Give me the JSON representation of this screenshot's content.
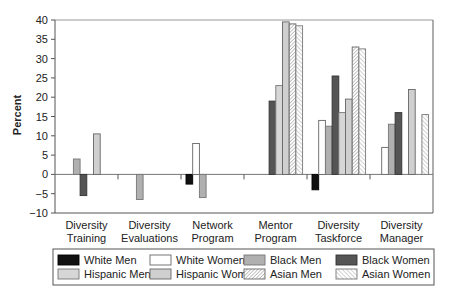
{
  "chart_data": {
    "type": "bar",
    "title": "",
    "xlabel": "",
    "ylabel": "Percent",
    "ylim": [
      -10,
      40
    ],
    "yticks": [
      40,
      35,
      30,
      25,
      20,
      15,
      10,
      5,
      0,
      -5,
      -10
    ],
    "grid": false,
    "legend_position": "bottom",
    "categories": [
      "Diversity Training",
      "Diversity Evaluations",
      "Network Program",
      "Mentor Program",
      "Diversity Taskforce",
      "Diversity Manager"
    ],
    "category_labels": [
      [
        "Diversity",
        "Training"
      ],
      [
        "Diversity",
        "Evaluations"
      ],
      [
        "Network",
        "Program"
      ],
      [
        "Mentor",
        "Program"
      ],
      [
        "Diversity",
        "Taskforce"
      ],
      [
        "Diversity",
        "Manager"
      ]
    ],
    "series": [
      {
        "name": "White Men",
        "pattern": "solid-black",
        "values": [
          null,
          null,
          -2.5,
          null,
          -4,
          null
        ]
      },
      {
        "name": "White Women",
        "pattern": "white",
        "values": [
          null,
          null,
          8,
          null,
          14,
          7
        ]
      },
      {
        "name": "Black Men",
        "pattern": "light-gray",
        "values": [
          4,
          -6.5,
          -6,
          null,
          12.5,
          13
        ]
      },
      {
        "name": "Black Women",
        "pattern": "dark-gray",
        "values": [
          -5.5,
          null,
          null,
          19,
          25.5,
          16
        ]
      },
      {
        "name": "Hispanic Men",
        "pattern": "vertical-lines",
        "values": [
          null,
          null,
          null,
          23,
          16,
          null
        ]
      },
      {
        "name": "Hispanic Women",
        "pattern": "horizontal-lines",
        "values": [
          10.5,
          null,
          null,
          39.5,
          19.5,
          22
        ]
      },
      {
        "name": "Asian Men",
        "pattern": "diag-dense",
        "values": [
          null,
          null,
          null,
          39,
          33,
          null
        ]
      },
      {
        "name": "Asian Women",
        "pattern": "diag-sparse",
        "values": [
          null,
          null,
          null,
          38.5,
          32.5,
          15.5
        ]
      }
    ]
  },
  "legend": {
    "rows": [
      [
        "White Men",
        "White Women",
        "Black Men",
        "Black Women"
      ],
      [
        "Hispanic Men",
        "Hispanic Women",
        "Asian Men",
        "Asian Women"
      ]
    ]
  },
  "colors": {
    "white_men": "#111111",
    "white_women": "#ffffff",
    "black_men": "#b0b0b0",
    "black_women": "#555555",
    "axis": "#555555"
  }
}
